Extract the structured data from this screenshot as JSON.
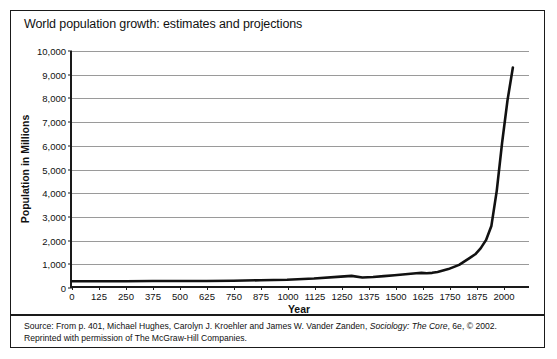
{
  "figure": {
    "title": "World population growth: estimates and projections",
    "source_line1_pre": "Source: From p. 401, Michael Hughes, Carolyn J. Kroehler and James W. Vander Zanden, ",
    "source_line1_italic": "Sociology: The Core",
    "source_line1_post": ", 6e, © 2002.",
    "source_line2": "Reprinted with permission of The McGraw-Hill Companies."
  },
  "chart_data": {
    "type": "line",
    "title": "World population growth: estimates and projections",
    "xlabel": "Year",
    "ylabel": "Population in Millions",
    "xlim": [
      0,
      2125
    ],
    "ylim": [
      0,
      10000
    ],
    "grid": true,
    "legend": "none",
    "line_color": "#111111",
    "gridline_color": "#9a9a9a",
    "xticks": [
      0,
      125,
      250,
      375,
      500,
      625,
      750,
      875,
      1000,
      1125,
      1250,
      1375,
      1500,
      1625,
      1750,
      1875,
      2000
    ],
    "yticks": [
      0,
      1000,
      2000,
      3000,
      4000,
      5000,
      6000,
      7000,
      8000,
      9000,
      10000
    ],
    "ytick_labels": [
      "0",
      "1,000",
      "2,000",
      "3,000",
      "4,000",
      "5,000",
      "6,000",
      "7,000",
      "8,000",
      "9,000",
      "10,000"
    ],
    "x": [
      0,
      125,
      250,
      375,
      500,
      625,
      750,
      875,
      1000,
      1125,
      1250,
      1300,
      1350,
      1400,
      1450,
      1500,
      1550,
      1600,
      1625,
      1650,
      1675,
      1700,
      1750,
      1800,
      1850,
      1875,
      1900,
      1925,
      1950,
      1975,
      2000,
      2025,
      2050
    ],
    "y": [
      200,
      200,
      205,
      210,
      210,
      215,
      225,
      245,
      265,
      320,
      400,
      430,
      360,
      380,
      420,
      460,
      500,
      545,
      560,
      545,
      560,
      600,
      720,
      900,
      1200,
      1350,
      1600,
      1950,
      2550,
      4050,
      6100,
      7900,
      9300
    ],
    "series": [
      {
        "name": "World population",
        "values": [
          200,
          200,
          205,
          210,
          210,
          215,
          225,
          245,
          265,
          320,
          400,
          430,
          360,
          380,
          420,
          460,
          500,
          545,
          560,
          545,
          560,
          600,
          720,
          900,
          1200,
          1350,
          1600,
          1950,
          2550,
          4050,
          6100,
          7900,
          9300
        ]
      }
    ],
    "annotations": [
      "Flat near 200-265 million from year 0 to 1000",
      "Dip near 1350 from the Black Death",
      "Plateau near 1650",
      "Exponential rise after 1750 reaching about 9,300 million"
    ]
  }
}
